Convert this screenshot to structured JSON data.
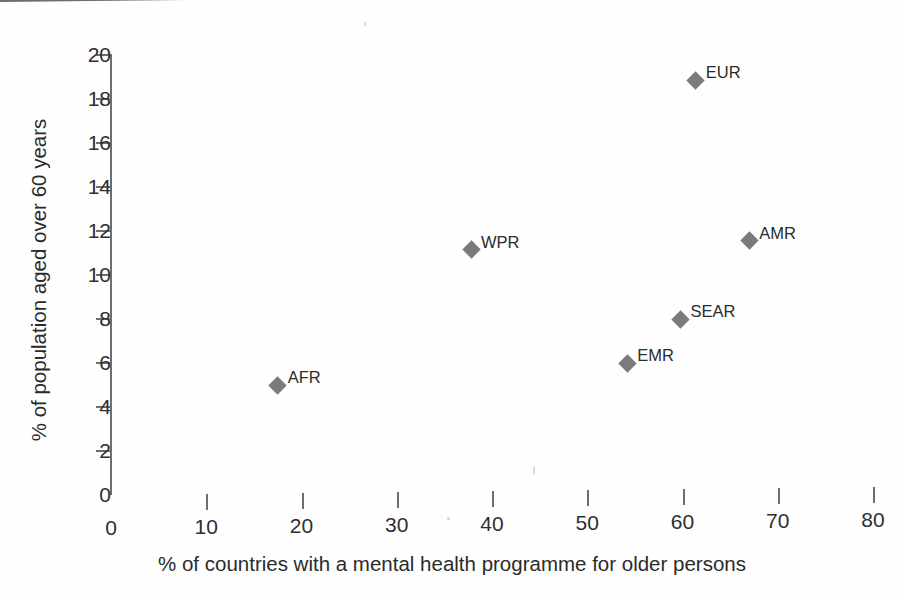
{
  "chart_data": {
    "type": "scatter",
    "title": "",
    "xlabel": "% of countries with a mental health programme for older persons",
    "ylabel": "% of population aged over 60 years",
    "xlim": [
      0,
      80
    ],
    "ylim": [
      0,
      20
    ],
    "xticks": [
      "0",
      "10",
      "20",
      "30",
      "40",
      "50",
      "60",
      "70",
      "80"
    ],
    "xtick_values": [
      0,
      10,
      20,
      30,
      40,
      50,
      60,
      70,
      80
    ],
    "yticks": [
      "0",
      "2",
      "4",
      "6",
      "8",
      "10",
      "12",
      "14",
      "16",
      "18",
      "20"
    ],
    "ytick_values": [
      0,
      2,
      4,
      6,
      8,
      10,
      12,
      14,
      16,
      18,
      20
    ],
    "grid": false,
    "legend": "none",
    "marker": "diamond",
    "marker_color": "#7b7b7b",
    "axis_color": "#6e6e6e",
    "points": [
      {
        "label": "AFR",
        "x": 17.5,
        "y": 5.0,
        "label_dx": 10,
        "label_dy": -16
      },
      {
        "label": "WPR",
        "x": 37.8,
        "y": 11.15,
        "label_dx": 10,
        "label_dy": -16
      },
      {
        "label": "EMR",
        "x": 54.2,
        "y": 6.0,
        "label_dx": 10,
        "label_dy": -16
      },
      {
        "label": "SEAR",
        "x": 59.8,
        "y": 8.0,
        "label_dx": 10,
        "label_dy": -16
      },
      {
        "label": "EUR",
        "x": 61.4,
        "y": 18.85,
        "label_dx": 10,
        "label_dy": -16
      },
      {
        "label": "AMR",
        "x": 67.0,
        "y": 11.55,
        "label_dx": 10,
        "label_dy": -16
      }
    ]
  }
}
